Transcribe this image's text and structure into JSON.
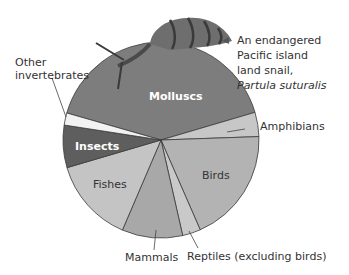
{
  "chart_data": {
    "type": "pie",
    "title": "",
    "start_angle_deg": 286,
    "direction": "clockwise",
    "slices": [
      {
        "label": "Molluscs",
        "value": 41,
        "color": "#7d7d7d"
      },
      {
        "label": "Amphibians",
        "value": 4,
        "color": "#c7c7c7"
      },
      {
        "label": "Birds",
        "value": 19,
        "color": "#b3b3b3"
      },
      {
        "label": "Reptiles (excluding birds)",
        "value": 3,
        "color": "#c9c9c9"
      },
      {
        "label": "Mammals",
        "value": 10,
        "color": "#a8a8a8"
      },
      {
        "label": "Fishes",
        "value": 14,
        "color": "#c4c4c4"
      },
      {
        "label": "Insects",
        "value": 7,
        "color": "#5e5e5e"
      },
      {
        "label": "Other invertebrates",
        "value": 2,
        "color": "#f2f2f2"
      }
    ],
    "annotations": [
      "An endangered Pacific island land snail, Partula suturalis"
    ]
  },
  "labels": {
    "molluscs": "Molluscs",
    "amphibians": "Amphibians",
    "birds": "Birds",
    "reptiles": "Reptiles (excluding birds)",
    "mammals": "Mammals",
    "fishes": "Fishes",
    "insects": "Insects",
    "other_line1": "Other",
    "other_line2": "invertebrates"
  },
  "caption": {
    "line1": "An endangered",
    "line2": "Pacific island",
    "line3": "land snail,",
    "species": "Partula suturalis"
  }
}
